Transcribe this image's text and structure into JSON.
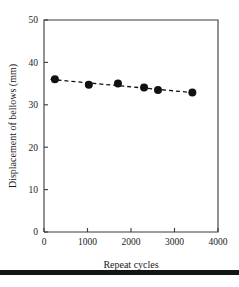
{
  "chart_data": {
    "type": "scatter",
    "title": "",
    "xlabel": "Repeat cycles",
    "ylabel": "Displacement of bellows (mm)",
    "xlim": [
      0,
      4000
    ],
    "ylim": [
      0,
      50
    ],
    "xticks": [
      0,
      1000,
      2000,
      3000,
      4000
    ],
    "yticks": [
      0,
      10,
      20,
      30,
      40,
      50
    ],
    "xtick_labels": [
      "0",
      "1000",
      "2000",
      "3000",
      "4000"
    ],
    "ytick_labels": [
      "0",
      "10",
      "20",
      "30",
      "40",
      "50"
    ],
    "grid": false,
    "legend": null,
    "series": [
      {
        "name": "Displacement of bellows",
        "marker": "filled-circle",
        "marker_color": "#111111",
        "x": [
          250,
          1030,
          1700,
          2300,
          2620,
          3410
        ],
        "y": [
          36.0,
          34.7,
          35.0,
          34.1,
          33.5,
          32.9
        ]
      },
      {
        "name": "Trend line",
        "style": "dashed",
        "line_color": "#111111",
        "x": [
          150,
          3500
        ],
        "y": [
          36.0,
          32.8
        ]
      }
    ],
    "annotations": []
  },
  "figure": {
    "axis_color": "#3a3a3a",
    "marker_color": "#111111",
    "background": "#ffffff",
    "bottom_rule_color": "#141414"
  }
}
